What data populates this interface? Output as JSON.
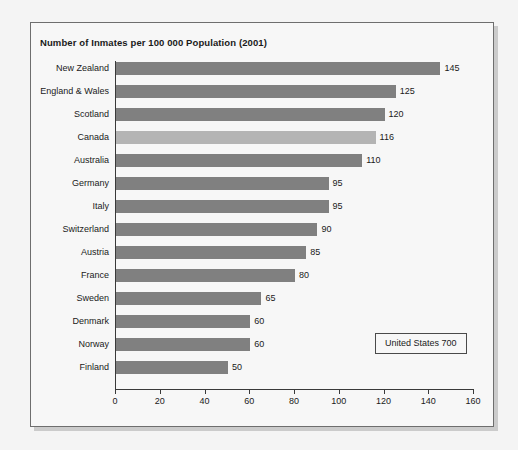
{
  "panel": {
    "title": "Number of Inmates per 100 000 Population (2001)"
  },
  "annotation": {
    "text": "United States  700"
  },
  "chart_data": {
    "type": "bar",
    "orientation": "horizontal",
    "title": "Number of Inmates per 100 000 Population (2001)",
    "xlabel": "",
    "ylabel": "",
    "xlim": [
      0,
      160
    ],
    "xticks": [
      0,
      20,
      40,
      60,
      80,
      100,
      120,
      140,
      160
    ],
    "grid": false,
    "legend": null,
    "highlight_category": "Canada",
    "colors": {
      "bar": "#808080",
      "bar_highlight": "#b4b4b4",
      "axis": "#3a3a3a",
      "text": "#1a1a1a",
      "panel_background": "#f7f7f7",
      "page_background": "#f4f4f4",
      "panel_border": "#6e6e6e"
    },
    "categories": [
      "New Zealand",
      "England & Wales",
      "Scotland",
      "Canada",
      "Australia",
      "Germany",
      "Italy",
      "Switzerland",
      "Austria",
      "France",
      "Sweden",
      "Denmark",
      "Norway",
      "Finland"
    ],
    "values": [
      145,
      125,
      120,
      116,
      110,
      95,
      95,
      90,
      85,
      80,
      65,
      60,
      60,
      50
    ],
    "annotations": [
      {
        "label": "United States",
        "value": 700,
        "text": "United States  700"
      }
    ]
  }
}
